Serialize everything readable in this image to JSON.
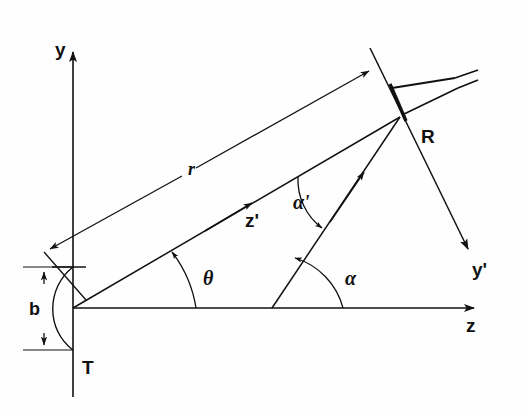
{
  "figure": {
    "kind": "geometry-diagram",
    "background_color": "#fefefe",
    "ink_color": "#111111"
  },
  "axes": [
    {
      "id": "y",
      "label": "y",
      "kind": "axis-arrow",
      "direction": "up",
      "x": 55,
      "y": 40
    },
    {
      "id": "z",
      "label": "z",
      "kind": "axis-arrow",
      "direction": "right",
      "x": 466,
      "y": 316
    },
    {
      "id": "yp",
      "label": "y'",
      "kind": "axis-arrow",
      "direction": "down-right",
      "x": 472,
      "y": 260
    },
    {
      "id": "zp",
      "label": "z'",
      "kind": "axis-arrow",
      "direction": "up-right",
      "x": 245,
      "y": 211
    }
  ],
  "nodes": [
    {
      "id": "T",
      "label": "T",
      "name": "transmitter",
      "x": 82,
      "y": 358
    },
    {
      "id": "R",
      "label": "R",
      "name": "receiver",
      "x": 421,
      "y": 127
    }
  ],
  "angles": [
    {
      "id": "theta",
      "label": "θ",
      "name": "theta-angle",
      "x": 203,
      "y": 268
    },
    {
      "id": "alpha",
      "label": "α",
      "name": "alpha-angle",
      "x": 345,
      "y": 268
    },
    {
      "id": "alpha_prime",
      "label": "α'",
      "name": "alpha-prime-angle",
      "x": 293,
      "y": 192
    }
  ],
  "lengths": [
    {
      "id": "r",
      "label": "r",
      "name": "range-r",
      "x": 188,
      "y": 160
    },
    {
      "id": "b",
      "label": "b",
      "name": "offset-b",
      "x": 29,
      "y": 300
    }
  ],
  "geometry": {
    "origin": {
      "x": 73,
      "y": 308
    },
    "receiver_point": {
      "x": 400,
      "y": 117
    },
    "z_axis_end": {
      "x": 482,
      "y": 308
    },
    "y_axis_top": {
      "x": 73,
      "y": 44
    },
    "y_axis_bottom": {
      "x": 73,
      "y": 397
    },
    "alpha_base": {
      "x": 272,
      "y": 308
    },
    "b_top": {
      "x": 73,
      "y": 267
    },
    "b_bottom": {
      "x": 73,
      "y": 350
    }
  }
}
